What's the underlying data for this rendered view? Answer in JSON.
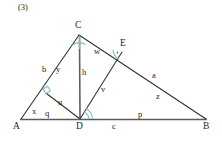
{
  "figure": {
    "problem_number": "(3)",
    "type": "geometry-diagram",
    "colors": {
      "line": "#2e2e2e",
      "baseline": "#555555",
      "angle_mark": "#7fb8d4",
      "background": "#ffffff",
      "text": "#1c1c1c"
    },
    "vertices": [
      {
        "name": "A",
        "label": "A",
        "x": 21,
        "y": 119,
        "label_x": 13,
        "label_y": 123
      },
      {
        "name": "B",
        "label": "B",
        "x": 206,
        "y": 119,
        "label_x": 203,
        "label_y": 123
      },
      {
        "name": "C",
        "label": "C",
        "x": 79,
        "y": 35,
        "label_x": 75,
        "label_y": 22
      },
      {
        "name": "D",
        "label": "D",
        "x": 80,
        "y": 119,
        "label_x": 76,
        "label_y": 123
      },
      {
        "name": "E",
        "label": "E",
        "x": 122,
        "y": 52,
        "label_x": 121,
        "label_y": 40
      },
      {
        "name": "F",
        "label": "",
        "x": 47,
        "y": 93,
        "label_x": 0,
        "label_y": 0
      }
    ],
    "segments": [
      {
        "name": "AB",
        "from": "A",
        "to": "B",
        "style": "base"
      },
      {
        "name": "AC",
        "from": "A",
        "to": "C",
        "style": "normal"
      },
      {
        "name": "CB",
        "from": "C",
        "to": "B",
        "style": "normal"
      },
      {
        "name": "CD",
        "from": "C",
        "to": "D",
        "style": "normal"
      },
      {
        "name": "DE",
        "from": "D",
        "to": "E",
        "style": "normal"
      },
      {
        "name": "DF",
        "from": "D",
        "to": "F",
        "style": "normal"
      }
    ],
    "side_labels": [
      {
        "name": "b",
        "label": "b",
        "x": 43,
        "y": 67
      },
      {
        "name": "y",
        "label": "y",
        "x": 57,
        "y": 67
      },
      {
        "name": "h",
        "label": "h",
        "x": 82,
        "y": 70
      },
      {
        "name": "w",
        "label": "w",
        "x": 95,
        "y": 49
      },
      {
        "name": "a",
        "label": "a",
        "x": 153,
        "y": 73
      },
      {
        "name": "z",
        "label": "z",
        "x": 157,
        "y": 94
      },
      {
        "name": "v",
        "label": "v",
        "x": 102,
        "y": 87
      },
      {
        "name": "u",
        "label": "u",
        "x": 59,
        "y": 100
      },
      {
        "name": "x",
        "label": "x",
        "x": 33,
        "y": 109
      },
      {
        "name": "q",
        "label": "q",
        "x": 46,
        "y": 111
      },
      {
        "name": "c",
        "label": "c",
        "x": 113,
        "y": 123
      },
      {
        "name": "p",
        "label": "p",
        "x": 139,
        "y": 112
      }
    ],
    "angle_marks": [
      {
        "name": "angle-at-C",
        "kind": "arc",
        "cx": 79,
        "cy": 35,
        "r": 9
      },
      {
        "name": "angle-at-F",
        "kind": "right-angle",
        "cx": 47,
        "cy": 93
      },
      {
        "name": "angle-at-D",
        "kind": "arc",
        "cx": 80,
        "cy": 119,
        "r": 10
      },
      {
        "name": "angle-at-E",
        "kind": "right-angle",
        "cx": 122,
        "cy": 52
      }
    ]
  }
}
